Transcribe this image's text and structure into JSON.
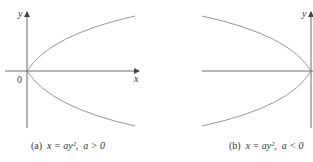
{
  "figure": {
    "panels": [
      {
        "id": "a",
        "label": "(a)",
        "equation": "x = ay²",
        "condition": "a > 0",
        "axes": {
          "x_label": "x",
          "y_label": "y",
          "origin_label": "0"
        },
        "opens": "right"
      },
      {
        "id": "b",
        "label": "(b)",
        "equation": "x = ay²",
        "condition": "a < 0",
        "axes": {
          "y_label": "y"
        },
        "opens": "left"
      }
    ],
    "colors": {
      "axis": "#444444",
      "curve": "#8a8a8a",
      "text": "#333333"
    }
  }
}
